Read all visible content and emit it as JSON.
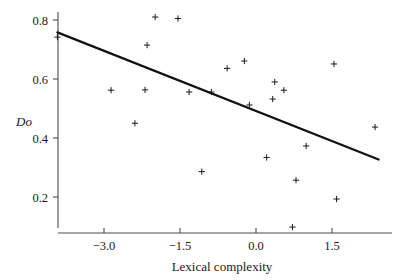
{
  "chart_data": {
    "type": "scatter",
    "title": "",
    "xlabel": "Lexical complexity",
    "ylabel": "Do",
    "ylabel_style": "italic",
    "xlim": [
      -3.92,
      2.45
    ],
    "ylim": [
      0.07,
      0.845
    ],
    "xticks": [
      -3.0,
      -1.5,
      0.0,
      1.5
    ],
    "xticklabels": [
      "−3.0",
      "−1.5",
      "0.0",
      "1.5"
    ],
    "yticks": [
      0.2,
      0.4,
      0.6,
      0.8
    ],
    "yticklabels": [
      "0.2",
      "0.4",
      "0.6",
      "0.8"
    ],
    "grid": false,
    "legend": null,
    "marker": "plus",
    "marker_color": "#1a1a1a",
    "line_color": "#111111",
    "points": [
      {
        "x": -3.92,
        "y": 0.742
      },
      {
        "x": -2.86,
        "y": 0.562
      },
      {
        "x": -2.39,
        "y": 0.45
      },
      {
        "x": -2.19,
        "y": 0.563
      },
      {
        "x": -2.15,
        "y": 0.715
      },
      {
        "x": -1.99,
        "y": 0.81
      },
      {
        "x": -1.54,
        "y": 0.805
      },
      {
        "x": -1.32,
        "y": 0.556
      },
      {
        "x": -1.07,
        "y": 0.286
      },
      {
        "x": -0.88,
        "y": 0.556
      },
      {
        "x": -0.57,
        "y": 0.636
      },
      {
        "x": -0.23,
        "y": 0.661
      },
      {
        "x": -0.13,
        "y": 0.512
      },
      {
        "x": 0.21,
        "y": 0.334
      },
      {
        "x": 0.33,
        "y": 0.532
      },
      {
        "x": 0.37,
        "y": 0.59
      },
      {
        "x": 0.55,
        "y": 0.562
      },
      {
        "x": 0.72,
        "y": 0.098
      },
      {
        "x": 0.79,
        "y": 0.257
      },
      {
        "x": 0.99,
        "y": 0.373
      },
      {
        "x": 1.54,
        "y": 0.651
      },
      {
        "x": 1.59,
        "y": 0.193
      },
      {
        "x": 2.35,
        "y": 0.437
      }
    ],
    "fit_line": {
      "x_start": -3.92,
      "y_start": 0.758,
      "x_end": 2.42,
      "y_end": 0.327,
      "slope": -0.068,
      "intercept": 0.491
    }
  },
  "figure": {
    "background_color": "#ffffff",
    "axis_color": "#4d4d4d",
    "text_color": "#1a1a1a"
  }
}
